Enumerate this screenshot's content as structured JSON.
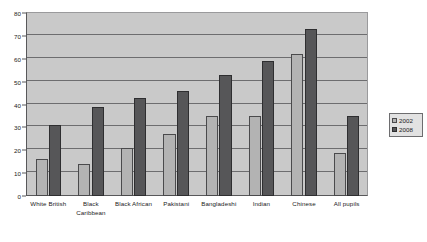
{
  "chart_data": {
    "type": "bar",
    "title": "",
    "xlabel": "",
    "ylabel": "",
    "ylim": [
      0,
      80
    ],
    "ytick_step": 10,
    "grid": true,
    "legend_position": "right",
    "categories": [
      "White British",
      "Black Caribbean",
      "Black African",
      "Pakistani",
      "Bangladeshi",
      "Indian",
      "Chinese",
      "All pupils"
    ],
    "category_lines": [
      [
        "White British"
      ],
      [
        "Black",
        "Caribbean"
      ],
      [
        "Black African"
      ],
      [
        "Pakistani"
      ],
      [
        "Bangladeshi"
      ],
      [
        "Indian"
      ],
      [
        "Chinese"
      ],
      [
        "All pupils"
      ]
    ],
    "yticks": [
      0,
      10,
      20,
      30,
      40,
      50,
      60,
      70,
      80
    ],
    "series": [
      {
        "name": "2002",
        "color": "#b3b3b3",
        "values": [
          16,
          14,
          21,
          27,
          35,
          35,
          62,
          19
        ]
      },
      {
        "name": "2008",
        "color": "#565658",
        "values": [
          31,
          39,
          43,
          46,
          53,
          59,
          73,
          35
        ]
      }
    ]
  },
  "legend": {
    "entries": [
      {
        "label": "2002"
      },
      {
        "label": "2008"
      }
    ]
  },
  "colors": {
    "series_2002": "#b3b3b3",
    "series_2008": "#565658",
    "plot_background": "#c9c9c9",
    "gridline": "#6d6d6f",
    "axis": "#58585a",
    "legend_background": "#e2e2e2"
  }
}
